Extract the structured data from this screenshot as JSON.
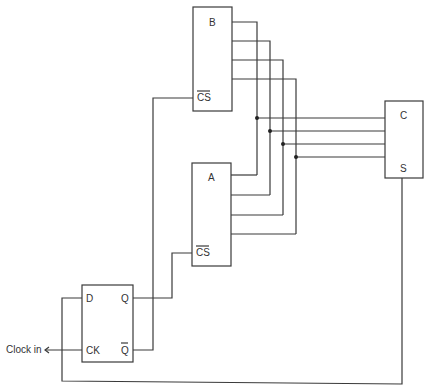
{
  "diagram": {
    "type": "circuit-schematic",
    "components": {
      "memory_b": {
        "label": "B",
        "cs_label": "CS"
      },
      "memory_a": {
        "label": "A",
        "cs_label": "CS"
      },
      "unit_c": {
        "label": "C",
        "s_label": "S"
      },
      "flip_flop": {
        "d_label": "D",
        "q_label": "Q",
        "ck_label": "CK",
        "qbar_label": "Q"
      }
    },
    "input_label": "Clock in",
    "bus_width": 4,
    "colors": {
      "line": "#3a3a3a",
      "background": "#ffffff"
    }
  }
}
